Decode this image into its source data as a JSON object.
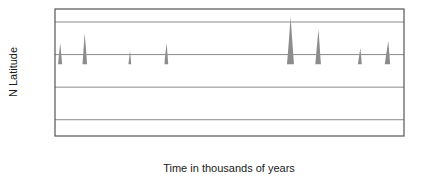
{
  "chart_data": {
    "type": "line",
    "title": "",
    "xlabel": "Time in thousands of years",
    "ylabel": "N Latitude",
    "xlim": [
      600,
      0
    ],
    "ylim": [
      57.5,
      77.0
    ],
    "x_reversed": true,
    "grid": true,
    "gridlines_y": [
      60,
      65,
      70,
      75
    ],
    "legend": null,
    "xtick_labels": [
      "600",
      "500",
      "400",
      "300",
      "200",
      "100",
      "0"
    ],
    "xtick_values": [
      600,
      500,
      400,
      300,
      200,
      100,
      0
    ],
    "xminor_tick_values": [
      550,
      450,
      350,
      250,
      150,
      50
    ],
    "ytick_labels": [
      "75°",
      "70°",
      "65°",
      "60°"
    ],
    "ytick_values": [
      75,
      70,
      65,
      60
    ],
    "series_name": "Summer insolation latitude",
    "line_color": "#111111",
    "fill_color": "#8c8c8c",
    "fill_threshold": 68.5,
    "axis_color": "#555555",
    "grid_color": "#8a8a8a",
    "x": [
      600,
      597,
      594,
      591,
      588,
      585,
      582,
      579,
      576,
      573,
      570,
      567,
      564,
      561,
      558,
      555,
      552,
      549,
      546,
      543,
      540,
      537,
      534,
      531,
      528,
      525,
      522,
      519,
      516,
      513,
      510,
      507,
      504,
      501,
      498,
      495,
      492,
      489,
      486,
      483,
      480,
      477,
      474,
      471,
      468,
      465,
      462,
      459,
      456,
      453,
      450,
      447,
      444,
      441,
      438,
      435,
      432,
      429,
      426,
      423,
      420,
      417,
      414,
      411,
      408,
      405,
      402,
      399,
      396,
      393,
      390,
      387,
      384,
      381,
      378,
      375,
      372,
      369,
      366,
      363,
      360,
      357,
      354,
      351,
      348,
      345,
      342,
      339,
      336,
      333,
      330,
      327,
      324,
      321,
      318,
      315,
      312,
      309,
      306,
      303,
      300,
      297,
      294,
      291,
      288,
      285,
      282,
      279,
      276,
      273,
      270,
      267,
      264,
      261,
      258,
      255,
      252,
      249,
      246,
      243,
      240,
      237,
      234,
      231,
      228,
      225,
      222,
      219,
      216,
      213,
      210,
      207,
      204,
      201,
      198,
      195,
      192,
      189,
      186,
      183,
      180,
      177,
      174,
      171,
      168,
      165,
      162,
      159,
      156,
      153,
      150,
      147,
      144,
      141,
      138,
      135,
      132,
      129,
      126,
      123,
      120,
      117,
      114,
      111,
      108,
      105,
      102,
      99,
      96,
      93,
      90,
      87,
      84,
      81,
      78,
      75,
      72,
      69,
      66,
      63,
      60,
      57,
      54,
      51,
      48,
      45,
      42,
      39,
      36,
      33,
      30,
      27,
      24,
      21,
      18,
      15,
      12,
      9,
      6,
      3,
      0
    ],
    "y": [
      63.9,
      66.0,
      69.2,
      71.8,
      68.8,
      65.0,
      61.6,
      58.6,
      61.5,
      64.5,
      66.9,
      66.4,
      64.0,
      61.5,
      63.2,
      65.8,
      69.5,
      73.3,
      70.0,
      66.2,
      63.0,
      60.0,
      59.9,
      61.2,
      62.3,
      63.1,
      63.6,
      63.9,
      64.0,
      64.1,
      64.2,
      64.3,
      64.4,
      64.6,
      64.9,
      64.9,
      64.5,
      63.1,
      61.4,
      60.4,
      62.5,
      65.5,
      68.3,
      70.6,
      67.5,
      64.2,
      62.5,
      61.4,
      62.6,
      64.1,
      65.1,
      64.9,
      63.8,
      62.6,
      61.5,
      62.4,
      63.5,
      64.0,
      63.3,
      61.9,
      60.7,
      62.5,
      66.0,
      69.5,
      71.8,
      68.0,
      64.5,
      62.8,
      62.9,
      63.3,
      62.5,
      61.1,
      61.2,
      61.6,
      62.6,
      63.8,
      65.0,
      66.1,
      66.3,
      65.8,
      65.2,
      65.2,
      65.2,
      65.2,
      64.0,
      62.3,
      60.7,
      59.5,
      61.3,
      63.2,
      64.7,
      65.5,
      65.4,
      65.3,
      65.5,
      66.0,
      66.5,
      66.7,
      65.1,
      63.0,
      61.0,
      59.8,
      61.5,
      63.4,
      64.8,
      65.2,
      64.5,
      63.6,
      64.7,
      66.1,
      67.4,
      66.3,
      64.5,
      62.6,
      61.3,
      59.4,
      61.3,
      63.3,
      65.0,
      66.3,
      66.6,
      66.4,
      65.9,
      65.4,
      65.2,
      65.0,
      64.6,
      64.0,
      63.1,
      62.2,
      61.4,
      62.6,
      64.9,
      68.7,
      72.0,
      75.8,
      72.0,
      68.3,
      65.0,
      62.8,
      61.0,
      62.3,
      63.5,
      64.4,
      63.2,
      61.8,
      60.8,
      62.2,
      64.4,
      68.0,
      71.0,
      73.9,
      70.0,
      66.2,
      63.0,
      60.3,
      62.0,
      63.9,
      65.1,
      65.0,
      64.3,
      63.9,
      64.2,
      65.0,
      65.9,
      66.9,
      65.0,
      63.1,
      61.2,
      59.1,
      61.2,
      63.3,
      65.5,
      67.5,
      69.3,
      71.0,
      68.0,
      65.0,
      63.0,
      64.0,
      65.1,
      64.9,
      64.2,
      63.0,
      61.5,
      60.1,
      62.0,
      64.3,
      66.5,
      68.6,
      70.4,
      72.1,
      68.8,
      65.4,
      63.3,
      61.5,
      62.7,
      63.9,
      65.0,
      66.3,
      67.6,
      68.9,
      67.0,
      64.8,
      62.5,
      60.2,
      61.1,
      62.6,
      64.8
    ]
  },
  "axes": {
    "x_axis_label": "Time in thousands of years",
    "y_axis_label": "N Latitude"
  }
}
